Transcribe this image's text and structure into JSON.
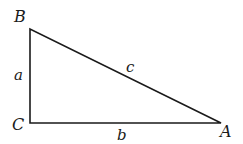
{
  "diagram": {
    "vertices": {
      "B": {
        "label": "B",
        "x": 30,
        "y": 29
      },
      "C": {
        "label": "C",
        "x": 30,
        "y": 123
      },
      "A": {
        "label": "A",
        "x": 221,
        "y": 123
      }
    },
    "sides": {
      "a": {
        "label": "a",
        "from": "B",
        "to": "C"
      },
      "b": {
        "label": "b",
        "from": "C",
        "to": "A"
      },
      "c": {
        "label": "c",
        "from": "B",
        "to": "A"
      }
    },
    "colors": {
      "stroke": "#1a1a1a",
      "background": "#ffffff"
    }
  }
}
